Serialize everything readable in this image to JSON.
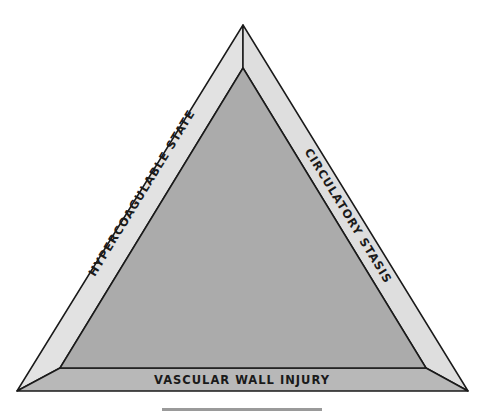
{
  "diagram": {
    "sides": [
      {
        "id": "left",
        "label": "HYPERCOAGULABLE STATE"
      },
      {
        "id": "right",
        "label": "CIRCULATORY STASIS"
      },
      {
        "id": "bottom",
        "label": "VASCULAR WALL INJURY"
      }
    ],
    "colors": {
      "inner_fill": "#ababab",
      "left_band": "#e2e2e2",
      "right_band": "#dedede",
      "bottom_band": "#b8b8b8",
      "outline": "#1a1a1a"
    }
  }
}
